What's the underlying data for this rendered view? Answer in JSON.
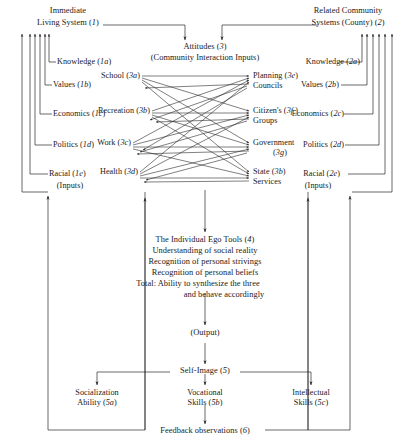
{
  "diagram": {
    "left_system": {
      "header_line1": "Immediate",
      "header_line2": "Living System (1)",
      "inputs_note": "(Inputs)",
      "items": [
        {
          "label": "Knowledge (1a)"
        },
        {
          "label": "Values (1b)"
        },
        {
          "label": "Economics (1c)"
        },
        {
          "label": "Politics (1d)"
        },
        {
          "label": "Racial (1e)"
        }
      ]
    },
    "right_system": {
      "header_line1": "Related Community",
      "header_line2": "Systems (County) (2)",
      "inputs_note": "(Inputs)",
      "items": [
        {
          "label": "Knowledge (2a)"
        },
        {
          "label": "Values (2b)"
        },
        {
          "label": "Economics (2c)"
        },
        {
          "label": "Politics (2d)"
        },
        {
          "label": "Racial (2e)"
        }
      ]
    },
    "attitudes": {
      "title": "Attitudes (3)",
      "subtitle": "(Community Interaction Inputs)"
    },
    "interaction_left": [
      {
        "label": "School (3a)"
      },
      {
        "label": "Recreation (3b)"
      },
      {
        "label": "Work (3c)"
      },
      {
        "label": "Health (3d)"
      }
    ],
    "interaction_right": [
      {
        "line1": "Planning (3e)",
        "line2": "Councils"
      },
      {
        "line1": "Citizen's (3f )",
        "line2": "Groups"
      },
      {
        "line1": "Government",
        "line2": "(3g)"
      },
      {
        "line1": "State (3b)",
        "line2": "Services"
      }
    ],
    "ego_tools": {
      "line1": "The Individual Ego Tools (4)",
      "line2": "Understanding of social reality",
      "line3": "Recognition of personal strivings",
      "line4": "Recognition of personal beliefs",
      "line5": "Total:  Ability to synthesize the three",
      "line6": "and behave accordingly"
    },
    "output_label": "(Output)",
    "self_image": "Self-Image (5)",
    "outcomes": [
      {
        "line1": "Socialization",
        "line2": "Ability (5a)"
      },
      {
        "line1": "Vocational",
        "line2": "Skills (5b)"
      },
      {
        "line1": "Intellectual",
        "line2": "Skills (5c)"
      }
    ],
    "feedback": "Feedback observations (6)",
    "colors": {
      "ink": "#1a1a1a",
      "line": "#2a2a2a",
      "background": "#ffffff"
    }
  }
}
